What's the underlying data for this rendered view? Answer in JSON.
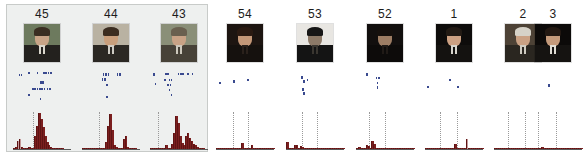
{
  "figure": {
    "title": "",
    "background_color": "#ffffff",
    "highlight_group": {
      "label": "",
      "fill_color": "#eef0ef",
      "border_color": "#c8cbc9",
      "panel_ids": [
        "45",
        "44",
        "43"
      ]
    },
    "bar_color": "#7b1f1f",
    "scatter_color": "#3a4a8f",
    "gridline_style": "dotted"
  },
  "chart_data": {
    "type": "bar",
    "title": "",
    "xlabel": "",
    "ylabel": "",
    "grid": true,
    "legend_position": "none",
    "panel_count": 9,
    "categories": [
      "b0",
      "b1",
      "b2",
      "b3",
      "b4",
      "b5",
      "b6",
      "b7",
      "b8",
      "b9",
      "b10",
      "b11",
      "b12",
      "b13",
      "b14",
      "b15",
      "b16",
      "b17",
      "b18",
      "b19",
      "b20",
      "b21",
      "b22",
      "b23",
      "b24",
      "b25",
      "b26",
      "b27",
      "b28",
      "b29"
    ],
    "ylim": [
      0,
      100
    ],
    "panels": [
      {
        "id": "45",
        "photo_alt": "portrait-45",
        "gridlines": [
          0.34
        ],
        "values": [
          4,
          6,
          22,
          26,
          6,
          4,
          3,
          2,
          6,
          3,
          3,
          34,
          62,
          96,
          80,
          58,
          34,
          20,
          10,
          6,
          3,
          2,
          2,
          1,
          1,
          1,
          0,
          0,
          0,
          0
        ],
        "pale_bars": [
          2,
          3
        ],
        "scatter": [
          {
            "x": 0.1,
            "y": 0.12
          },
          {
            "x": 0.13,
            "y": 0.12
          },
          {
            "x": 0.26,
            "y": 0.06
          },
          {
            "x": 0.41,
            "y": 0.06
          },
          {
            "x": 0.52,
            "y": 0.05
          },
          {
            "x": 0.56,
            "y": 0.05
          },
          {
            "x": 0.6,
            "y": 0.05
          },
          {
            "x": 0.64,
            "y": 0.05
          },
          {
            "x": 0.47,
            "y": 0.33
          },
          {
            "x": 0.5,
            "y": 0.33
          },
          {
            "x": 0.33,
            "y": 0.52
          },
          {
            "x": 0.37,
            "y": 0.52
          },
          {
            "x": 0.41,
            "y": 0.52
          },
          {
            "x": 0.45,
            "y": 0.52
          },
          {
            "x": 0.49,
            "y": 0.52
          },
          {
            "x": 0.53,
            "y": 0.52
          },
          {
            "x": 0.58,
            "y": 0.52
          },
          {
            "x": 0.62,
            "y": 0.52
          },
          {
            "x": 0.26,
            "y": 0.7
          },
          {
            "x": 0.46,
            "y": 0.82
          }
        ]
      },
      {
        "id": "44",
        "photo_alt": "portrait-44",
        "gridlines": [
          0.3
        ],
        "values": [
          1,
          1,
          1,
          1,
          1,
          1,
          1,
          1,
          1,
          1,
          2,
          2,
          18,
          62,
          94,
          50,
          10,
          6,
          4,
          3,
          2,
          26,
          34,
          6,
          3,
          2,
          1,
          1,
          0,
          0
        ],
        "pale_bars": [],
        "scatter": [
          {
            "x": 0.36,
            "y": 0.1
          },
          {
            "x": 0.4,
            "y": 0.1
          },
          {
            "x": 0.44,
            "y": 0.1
          },
          {
            "x": 0.6,
            "y": 0.1
          },
          {
            "x": 0.64,
            "y": 0.1
          },
          {
            "x": 0.34,
            "y": 0.24
          },
          {
            "x": 0.38,
            "y": 0.24
          },
          {
            "x": 0.42,
            "y": 0.4
          },
          {
            "x": 0.42,
            "y": 0.76
          }
        ]
      },
      {
        "id": "43",
        "photo_alt": "portrait-43",
        "gridlines": [
          0.14
        ],
        "values": [
          1,
          1,
          1,
          1,
          1,
          2,
          2,
          3,
          10,
          4,
          3,
          14,
          44,
          88,
          70,
          36,
          16,
          10,
          34,
          42,
          30,
          22,
          14,
          10,
          6,
          3,
          2,
          1,
          0,
          0
        ],
        "pale_bars": [],
        "scatter": [
          {
            "x": 0.06,
            "y": 0.1
          },
          {
            "x": 0.26,
            "y": 0.08
          },
          {
            "x": 0.3,
            "y": 0.08
          },
          {
            "x": 0.48,
            "y": 0.08
          },
          {
            "x": 0.52,
            "y": 0.08
          },
          {
            "x": 0.56,
            "y": 0.08
          },
          {
            "x": 0.64,
            "y": 0.08
          },
          {
            "x": 0.72,
            "y": 0.08
          },
          {
            "x": 0.24,
            "y": 0.26
          },
          {
            "x": 0.32,
            "y": 0.26
          },
          {
            "x": 0.36,
            "y": 0.26
          },
          {
            "x": 0.08,
            "y": 0.38
          },
          {
            "x": 0.3,
            "y": 0.4
          },
          {
            "x": 0.34,
            "y": 0.4
          },
          {
            "x": 0.32,
            "y": 0.56
          },
          {
            "x": 0.36,
            "y": 0.7
          }
        ]
      },
      {
        "id": "54",
        "photo_alt": "portrait-54",
        "gridlines": [
          0.3,
          0.56
        ],
        "values": [
          3,
          2,
          1,
          1,
          2,
          4,
          2,
          1,
          1,
          1,
          2,
          1,
          1,
          16,
          2,
          1,
          1,
          1,
          12,
          2,
          1,
          1,
          2,
          1,
          1,
          1,
          1,
          1,
          1,
          1
        ],
        "pale_bars": [],
        "scatter": [
          {
            "x": 0.06,
            "y": 0.34
          },
          {
            "x": 0.3,
            "y": 0.3
          },
          {
            "x": 0.54,
            "y": 0.26
          }
        ]
      },
      {
        "id": "53",
        "photo_alt": "portrait-53",
        "gridlines": [
          0.28,
          0.54
        ],
        "values": [
          18,
          3,
          2,
          2,
          10,
          12,
          3,
          8,
          6,
          2,
          2,
          1,
          1,
          1,
          1,
          1,
          1,
          1,
          1,
          1,
          1,
          1,
          1,
          1,
          1,
          1,
          1,
          1,
          1,
          1
        ],
        "pale_bars": [],
        "scatter": [
          {
            "x": 0.26,
            "y": 0.18
          },
          {
            "x": 0.3,
            "y": 0.3
          },
          {
            "x": 0.36,
            "y": 0.26
          },
          {
            "x": 0.28,
            "y": 0.54
          },
          {
            "x": 0.3,
            "y": 0.66
          }
        ]
      },
      {
        "id": "52",
        "photo_alt": "portrait-52",
        "gridlines": [
          0.22,
          0.5
        ],
        "values": [
          2,
          6,
          4,
          2,
          3,
          10,
          8,
          2,
          22,
          14,
          4,
          2,
          2,
          1,
          1,
          1,
          1,
          1,
          1,
          1,
          1,
          1,
          1,
          1,
          1,
          1,
          1,
          1,
          1,
          1
        ],
        "pale_bars": [],
        "scatter": [
          {
            "x": 0.18,
            "y": 0.1
          },
          {
            "x": 0.34,
            "y": 0.2
          },
          {
            "x": 0.38,
            "y": 0.2
          },
          {
            "x": 0.36,
            "y": 0.34
          },
          {
            "x": 0.36,
            "y": 0.48
          }
        ]
      },
      {
        "id": "1",
        "photo_alt": "portrait-1",
        "gridlines": [
          0.26,
          0.56
        ],
        "values": [
          2,
          4,
          3,
          2,
          2,
          2,
          2,
          1,
          1,
          1,
          1,
          1,
          1,
          1,
          2,
          14,
          2,
          1,
          1,
          1,
          1,
          26,
          3,
          2,
          1,
          1,
          1,
          1,
          1,
          1
        ],
        "pale_bars": [
          21
        ],
        "scatter": [
          {
            "x": 0.04,
            "y": 0.46
          },
          {
            "x": 0.56,
            "y": 0.46
          },
          {
            "x": 0.42,
            "y": 0.26
          }
        ]
      },
      {
        "id": "2",
        "photo_alt": "portrait-2",
        "gridlines": [
          0.24,
          0.54
        ],
        "values": [
          1,
          1,
          1,
          1,
          1,
          1,
          1,
          1,
          1,
          1,
          1,
          1,
          1,
          1,
          1,
          1,
          1,
          1,
          1,
          1,
          1,
          1,
          1,
          1,
          1,
          1,
          1,
          1,
          1,
          1
        ],
        "pale_bars": [],
        "scatter": []
      },
      {
        "id": "3",
        "photo_alt": "portrait-3",
        "gridlines": [
          0.24,
          0.56
        ],
        "values": [
          1,
          1,
          1,
          1,
          1,
          2,
          1,
          1,
          1,
          6,
          3,
          2,
          1,
          1,
          1,
          1,
          1,
          1,
          1,
          1,
          1,
          1,
          1,
          1,
          1,
          1,
          1,
          1,
          1,
          1
        ],
        "pale_bars": [],
        "scatter": [
          {
            "x": 0.42,
            "y": 0.42
          }
        ]
      }
    ]
  }
}
